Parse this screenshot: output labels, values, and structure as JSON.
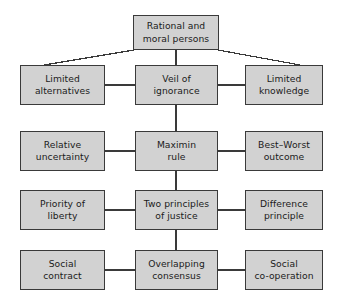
{
  "diagram": {
    "style": {
      "box_fill": "#d2d2d2",
      "box_border": "#3a3a3a",
      "connector_color": "#3a3a3a",
      "background": "#ffffff",
      "text_color": "#1b1b1b"
    },
    "nodes": [
      {
        "id": "rational-moral-persons",
        "label": "Rational and\nmoral persons",
        "row": 0,
        "column": "center",
        "x": 133,
        "y": 15,
        "w": 86,
        "h": 35
      },
      {
        "id": "limited-alternatives",
        "label": "Limited\nalternatives",
        "row": 1,
        "column": "left",
        "x": 20,
        "y": 65,
        "w": 85,
        "h": 40
      },
      {
        "id": "veil-of-ignorance",
        "label": "Veil of\nignorance",
        "row": 1,
        "column": "center",
        "x": 135,
        "y": 65,
        "w": 83,
        "h": 40
      },
      {
        "id": "limited-knowledge",
        "label": "Limited\nknowledge",
        "row": 1,
        "column": "right",
        "x": 245,
        "y": 65,
        "w": 78,
        "h": 40
      },
      {
        "id": "relative-uncertainty",
        "label": "Relative\nuncertainty",
        "row": 2,
        "column": "left",
        "x": 20,
        "y": 131,
        "w": 85,
        "h": 40
      },
      {
        "id": "maximin-rule",
        "label": "Maximin\nrule",
        "row": 2,
        "column": "center",
        "x": 135,
        "y": 131,
        "w": 83,
        "h": 40
      },
      {
        "id": "best-worst-outcome",
        "label": "Best–Worst\noutcome",
        "row": 2,
        "column": "right",
        "x": 245,
        "y": 131,
        "w": 78,
        "h": 40
      },
      {
        "id": "priority-of-liberty",
        "label": "Priority of\nliberty",
        "row": 3,
        "column": "left",
        "x": 20,
        "y": 190,
        "w": 85,
        "h": 40
      },
      {
        "id": "two-principles-of-justice",
        "label": "Two principles\nof justice",
        "row": 3,
        "column": "center",
        "x": 135,
        "y": 190,
        "w": 83,
        "h": 40
      },
      {
        "id": "difference-principle",
        "label": "Difference\nprinciple",
        "row": 3,
        "column": "right",
        "x": 245,
        "y": 190,
        "w": 78,
        "h": 40
      },
      {
        "id": "social-contract",
        "label": "Social\ncontract",
        "row": 4,
        "column": "left",
        "x": 20,
        "y": 250,
        "w": 85,
        "h": 40
      },
      {
        "id": "overlapping-consensus",
        "label": "Overlapping\nconsensus",
        "row": 4,
        "column": "center",
        "x": 135,
        "y": 250,
        "w": 83,
        "h": 40
      },
      {
        "id": "social-co-operation",
        "label": "Social\nco-operation",
        "row": 4,
        "column": "right",
        "x": 245,
        "y": 250,
        "w": 78,
        "h": 40
      }
    ],
    "connectors": [
      {
        "id": "top-to-veil",
        "kind": "vertical",
        "from": "rational-moral-persons",
        "to": "veil-of-ignorance",
        "x1": 176,
        "y1": 50,
        "x2": 176,
        "y2": 65
      },
      {
        "id": "top-to-limited-alternatives",
        "kind": "diagonal",
        "from": "rational-moral-persons",
        "to": "limited-alternatives",
        "x1": 134,
        "y1": 50,
        "x2": 44,
        "y2": 65
      },
      {
        "id": "top-to-limited-knowledge",
        "kind": "diagonal",
        "from": "rational-moral-persons",
        "to": "limited-knowledge",
        "x1": 218,
        "y1": 50,
        "x2": 300,
        "y2": 65
      },
      {
        "id": "limited-alternatives-to-veil",
        "kind": "horizontal",
        "from": "limited-alternatives",
        "to": "veil-of-ignorance",
        "x1": 105,
        "y1": 85,
        "x2": 135,
        "y2": 85
      },
      {
        "id": "veil-to-limited-knowledge",
        "kind": "horizontal",
        "from": "veil-of-ignorance",
        "to": "limited-knowledge",
        "x1": 218,
        "y1": 85,
        "x2": 245,
        "y2": 85
      },
      {
        "id": "veil-to-maximin",
        "kind": "vertical",
        "from": "veil-of-ignorance",
        "to": "maximin-rule",
        "x1": 176,
        "y1": 105,
        "x2": 176,
        "y2": 131
      },
      {
        "id": "relative-uncertainty-to-maximin",
        "kind": "horizontal",
        "from": "relative-uncertainty",
        "to": "maximin-rule",
        "x1": 105,
        "y1": 151,
        "x2": 135,
        "y2": 151
      },
      {
        "id": "maximin-to-best-worst",
        "kind": "horizontal",
        "from": "maximin-rule",
        "to": "best-worst-outcome",
        "x1": 218,
        "y1": 151,
        "x2": 245,
        "y2": 151
      },
      {
        "id": "maximin-to-two-principles",
        "kind": "vertical",
        "from": "maximin-rule",
        "to": "two-principles-of-justice",
        "x1": 176,
        "y1": 171,
        "x2": 176,
        "y2": 190
      },
      {
        "id": "priority-to-two-principles",
        "kind": "horizontal",
        "from": "priority-of-liberty",
        "to": "two-principles-of-justice",
        "x1": 105,
        "y1": 210,
        "x2": 135,
        "y2": 210
      },
      {
        "id": "two-principles-to-difference",
        "kind": "horizontal",
        "from": "two-principles-of-justice",
        "to": "difference-principle",
        "x1": 218,
        "y1": 210,
        "x2": 245,
        "y2": 210
      },
      {
        "id": "two-principles-to-overlapping",
        "kind": "vertical",
        "from": "two-principles-of-justice",
        "to": "overlapping-consensus",
        "x1": 176,
        "y1": 230,
        "x2": 176,
        "y2": 250
      },
      {
        "id": "social-contract-to-overlapping",
        "kind": "horizontal",
        "from": "social-contract",
        "to": "overlapping-consensus",
        "x1": 105,
        "y1": 270,
        "x2": 135,
        "y2": 270
      },
      {
        "id": "overlapping-to-social-co-operation",
        "kind": "horizontal",
        "from": "overlapping-consensus",
        "to": "social-co-operation",
        "x1": 218,
        "y1": 270,
        "x2": 245,
        "y2": 270
      }
    ]
  }
}
